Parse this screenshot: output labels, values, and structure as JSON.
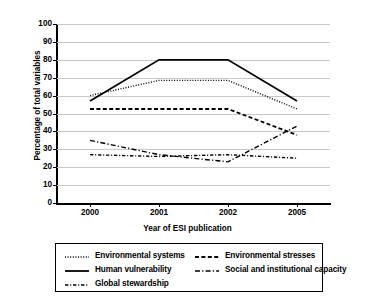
{
  "chart_data": {
    "type": "line",
    "title": "",
    "xlabel": "Year of ESI publication",
    "ylabel": "Percentage of total variables",
    "categories": [
      "2000",
      "2001",
      "2002",
      "2005"
    ],
    "ylim": [
      0,
      100
    ],
    "ytick_labels": [
      "100",
      "90",
      "80",
      "70",
      "60",
      "50",
      "40",
      "30",
      "20",
      "10",
      "0"
    ],
    "ytick_values": [
      100,
      90,
      80,
      70,
      60,
      50,
      40,
      30,
      20,
      10,
      0
    ],
    "grid": true,
    "legend_position": "below",
    "series": [
      {
        "name": "Environmental systems",
        "style": "dotted",
        "color": "#000000",
        "values": [
          60,
          68.5,
          68.5,
          52.5
        ]
      },
      {
        "name": "Environmental stresses",
        "style": "dashed",
        "color": "#000000",
        "values": [
          52.5,
          52.5,
          52.5,
          38
        ]
      },
      {
        "name": "Human vulnerability",
        "style": "solid",
        "color": "#000000",
        "values": [
          57,
          80,
          80,
          57
        ]
      },
      {
        "name": "Social and institutional capacity",
        "style": "dash-dot-long",
        "color": "#000000",
        "values": [
          35,
          27,
          23,
          43
        ]
      },
      {
        "name": "Global stewardship",
        "style": "dash-dot-fine",
        "color": "#000000",
        "values": [
          27,
          26,
          27,
          25
        ]
      }
    ]
  },
  "legend": {
    "entries": [
      {
        "label": "Environmental systems",
        "style": "dotted",
        "column": 0,
        "row": 0
      },
      {
        "label": "Environmental stresses",
        "style": "dashed",
        "column": 1,
        "row": 0
      },
      {
        "label": "Human vulnerability",
        "style": "solid",
        "column": 0,
        "row": 1
      },
      {
        "label": "Social and institutional capacity",
        "style": "dash-dot-long",
        "column": 1,
        "row": 1
      },
      {
        "label": "Global stewardship",
        "style": "dash-dot-fine",
        "column": 0,
        "row": 2
      }
    ]
  }
}
